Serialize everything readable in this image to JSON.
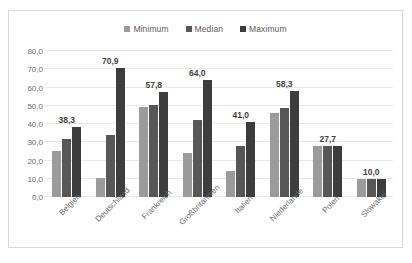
{
  "chart_data": {
    "type": "bar",
    "title": "",
    "subtitle": "",
    "xlabel": "",
    "ylabel": "",
    "categories": [
      "Belgien",
      "Deutschland",
      "Frankreich",
      "Großbritannien",
      "Italien",
      "Niederlande",
      "Polen",
      "Slowakei"
    ],
    "series": [
      {
        "name": "Minimum",
        "color": "#9b9b9b",
        "values": [
          25.0,
          10.5,
          49.5,
          24.0,
          14.5,
          46.0,
          27.7,
          10.0
        ]
      },
      {
        "name": "Median",
        "color": "#575757",
        "values": [
          32.0,
          34.0,
          50.5,
          42.0,
          28.0,
          49.0,
          27.7,
          10.0
        ]
      },
      {
        "name": "Maximum",
        "color": "#3d3d3d",
        "values": [
          38.3,
          70.9,
          57.8,
          64.0,
          41.0,
          58.3,
          27.7,
          10.0
        ]
      }
    ],
    "data_labels": [
      "38,3",
      "70,9",
      "57,8",
      "64,0",
      "41,0",
      "58,3",
      "27,7",
      "10,0"
    ],
    "ylim": [
      0,
      80
    ],
    "ytick_values": [
      0,
      10,
      20,
      30,
      40,
      50,
      60,
      70,
      80
    ],
    "ytick_labels": [
      "0,0",
      "10,0",
      "20,0",
      "30,0",
      "40,0",
      "50,0",
      "60,0",
      "70,0",
      "80,0"
    ],
    "grid": "horizontal",
    "legend_position": "top-center",
    "decimal_separator": ",",
    "gridline_color": "#e8e8e8",
    "border_color": "#d9d9d9"
  },
  "legend": {
    "items": [
      {
        "label": "Minimum",
        "marker": "square-swatch-light-gray"
      },
      {
        "label": "Median",
        "marker": "square-swatch-medium-gray"
      },
      {
        "label": "Maximum",
        "marker": "square-swatch-dark-gray"
      }
    ]
  }
}
